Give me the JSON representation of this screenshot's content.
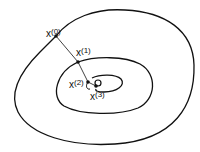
{
  "diagram": {
    "colors": {
      "line": "#111111",
      "background": "#ffffff"
    },
    "contours": [
      {
        "name": "outer-contour"
      },
      {
        "name": "middle-contour"
      },
      {
        "name": "inner-contour"
      },
      {
        "name": "minimum-circle"
      }
    ],
    "points": [
      {
        "base": "x",
        "index": "(0)",
        "x": 56,
        "y": 36
      },
      {
        "base": "x",
        "index": "(1)",
        "x": 78,
        "y": 62
      },
      {
        "base": "x",
        "index": "(2)",
        "x": 88,
        "y": 82
      },
      {
        "base": "x",
        "index": "(3)",
        "x": 96,
        "y": 86
      }
    ]
  }
}
